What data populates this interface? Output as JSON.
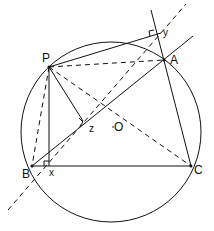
{
  "figure": {
    "labels": {
      "P": "P",
      "A": "A",
      "B": "B",
      "C": "C",
      "X": "x",
      "Y": "y",
      "Z": "z",
      "O": "O"
    },
    "points": {
      "P": [
        49,
        67
      ],
      "A": [
        164,
        60
      ],
      "B": [
        32,
        166
      ],
      "C": [
        191,
        166
      ],
      "X": [
        48,
        166
      ],
      "Y": [
        162,
        33
      ],
      "Z": [
        83,
        124
      ],
      "O": [
        115,
        128
      ]
    },
    "circle": {
      "cx": 111,
      "cy": 131,
      "r": 90
    },
    "stroke_color": "#111111"
  }
}
